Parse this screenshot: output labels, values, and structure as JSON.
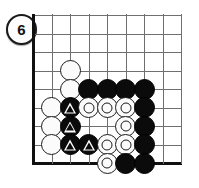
{
  "figure": {
    "kind": "go-board-diagram",
    "number_label": "6",
    "colors": {
      "black_stone": "#0b0b0b",
      "white_stone": "#fbfbfb",
      "grid_line": "#6f6f6f",
      "board_edge": "#101010",
      "background": "#ffffff"
    }
  },
  "board": {
    "origin_x": 33,
    "origin_y": 15,
    "cell": 18.5,
    "cols": 9,
    "rows": 9,
    "left_edge_is_board_edge": true,
    "bottom_edge_is_board_edge": true,
    "grid_vertical_count": 9,
    "grid_horizontal_count": 9
  },
  "stones": [
    {
      "color": "white",
      "mark": "none",
      "col": 2,
      "row": 3
    },
    {
      "color": "white",
      "mark": "none",
      "col": 2,
      "row": 4
    },
    {
      "color": "black",
      "mark": "none",
      "col": 3,
      "row": 4
    },
    {
      "color": "black",
      "mark": "none",
      "col": 4,
      "row": 4
    },
    {
      "color": "black",
      "mark": "none",
      "col": 5,
      "row": 4
    },
    {
      "color": "black",
      "mark": "none",
      "col": 6,
      "row": 4
    },
    {
      "color": "white",
      "mark": "none",
      "col": 1,
      "row": 5
    },
    {
      "color": "black",
      "mark": "triangle",
      "col": 2,
      "row": 5
    },
    {
      "color": "white",
      "mark": "circle",
      "col": 3,
      "row": 5
    },
    {
      "color": "white",
      "mark": "circle",
      "col": 4,
      "row": 5
    },
    {
      "color": "white",
      "mark": "circle",
      "col": 5,
      "row": 5
    },
    {
      "color": "black",
      "mark": "none",
      "col": 6,
      "row": 5
    },
    {
      "color": "white",
      "mark": "none",
      "col": 1,
      "row": 6
    },
    {
      "color": "black",
      "mark": "triangle",
      "col": 2,
      "row": 6
    },
    {
      "color": "white",
      "mark": "circle",
      "col": 5,
      "row": 6
    },
    {
      "color": "black",
      "mark": "none",
      "col": 6,
      "row": 6
    },
    {
      "color": "white",
      "mark": "none",
      "col": 1,
      "row": 7
    },
    {
      "color": "black",
      "mark": "triangle",
      "col": 2,
      "row": 7
    },
    {
      "color": "black",
      "mark": "triangle",
      "col": 3,
      "row": 7
    },
    {
      "color": "white",
      "mark": "circle",
      "col": 4,
      "row": 7
    },
    {
      "color": "white",
      "mark": "circle",
      "col": 5,
      "row": 7
    },
    {
      "color": "black",
      "mark": "none",
      "col": 6,
      "row": 7
    },
    {
      "color": "white",
      "mark": "circle",
      "col": 4,
      "row": 8
    },
    {
      "color": "black",
      "mark": "none",
      "col": 5,
      "row": 8
    },
    {
      "color": "black",
      "mark": "none",
      "col": 6,
      "row": 8
    }
  ]
}
